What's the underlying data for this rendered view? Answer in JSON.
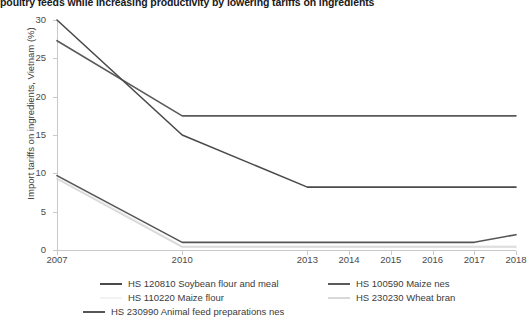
{
  "chart_data": {
    "type": "line",
    "title": "poultry feeds while increasing productivity by lowering tariffs on ingredients",
    "xlabel": "",
    "ylabel": "Import tariffs on ingredients, Vietnam (%)",
    "x": [
      2007,
      2010,
      2013,
      2014,
      2015,
      2016,
      2017,
      2018
    ],
    "xticklabels": [
      "2007",
      "2010",
      "2013",
      "2014",
      "2015",
      "2016",
      "2017",
      "2018"
    ],
    "yticklabels": [
      "0",
      "5",
      "10",
      "15",
      "20",
      "25",
      "30"
    ],
    "yticks": [
      0,
      5,
      10,
      15,
      20,
      25,
      30
    ],
    "xlim": [
      2007,
      2018
    ],
    "ylim": [
      0,
      30
    ],
    "grid": false,
    "legend_position": "below",
    "series": [
      {
        "name": "HS 120810 Soybean flour and meal",
        "color": "#4a4a4a",
        "values": [
          30.0,
          15.0,
          8.2,
          8.2,
          8.2,
          8.2,
          8.2,
          8.2
        ]
      },
      {
        "name": "HS 100590 Maize nes",
        "color": "#5a5a5a",
        "values": [
          27.3,
          17.5,
          17.5,
          17.5,
          17.5,
          17.5,
          17.5,
          17.5
        ]
      },
      {
        "name": "HS 110220 Maize flour",
        "color": "#f0f0f0",
        "values": [
          9.6,
          0.5,
          0.5,
          0.5,
          0.5,
          0.5,
          0.5,
          0.5
        ]
      },
      {
        "name": "HS 230230 Wheat bran",
        "color": "#d8d8d8",
        "values": [
          9.3,
          0.4,
          0.4,
          0.4,
          0.4,
          0.4,
          0.4,
          0.4
        ]
      },
      {
        "name": "HS 230990 Animal feed preparations nes",
        "color": "#555555",
        "values": [
          9.7,
          1.0,
          1.0,
          1.0,
          1.0,
          1.0,
          1.0,
          2.0
        ]
      }
    ]
  },
  "chart": {
    "title": "poultry feeds while increasing productivity by lowering tariffs on ingredients",
    "ylabel": "Import tariffs on ingredients, Vietnam (%)",
    "yticks": [
      "30",
      "25",
      "20",
      "15",
      "10",
      "5",
      "0"
    ],
    "xticks": [
      "2007",
      "2010",
      "2013",
      "2014",
      "2015",
      "2016",
      "2017",
      "2018"
    ]
  },
  "legend": {
    "items": [
      {
        "label": "HS 120810 Soybean flour and meal",
        "color": "#4a4a4a"
      },
      {
        "label": "HS 100590 Maize nes",
        "color": "#5a5a5a"
      },
      {
        "label": "HS 110220 Maize flour",
        "color": "#f2f2f2"
      },
      {
        "label": "HS 230230 Wheat bran",
        "color": "#d8d8d8"
      },
      {
        "label": "HS 230990 Animal feed preparations nes",
        "color": "#555555"
      }
    ]
  }
}
